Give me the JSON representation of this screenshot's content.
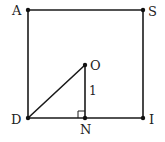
{
  "diagram": {
    "type": "geometry",
    "points": [
      {
        "id": "A",
        "label": "A"
      },
      {
        "id": "S",
        "label": "S"
      },
      {
        "id": "I",
        "label": "I"
      },
      {
        "id": "D",
        "label": "D"
      },
      {
        "id": "O",
        "label": "O"
      },
      {
        "id": "N",
        "label": "N"
      }
    ],
    "segments": [
      {
        "from": "A",
        "to": "S"
      },
      {
        "from": "S",
        "to": "I"
      },
      {
        "from": "I",
        "to": "D"
      },
      {
        "from": "D",
        "to": "A"
      },
      {
        "from": "D",
        "to": "O"
      },
      {
        "from": "O",
        "to": "N"
      }
    ],
    "measurements": [
      {
        "segment": "ON",
        "label": "1"
      }
    ],
    "right_angles": [
      {
        "vertex": "N",
        "between": [
          "O",
          "D"
        ]
      }
    ]
  }
}
